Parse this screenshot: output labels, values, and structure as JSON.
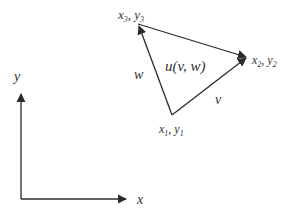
{
  "diagram": {
    "type": "triangle-element-with-coordinate-axes",
    "colors": {
      "stroke": "#2b2b2b",
      "text": "#333333",
      "background": "#ffffff"
    },
    "vertices": {
      "v1": {
        "label": "x",
        "sub": "1",
        "label2": "y",
        "sub2": "1",
        "x": 172,
        "y": 115
      },
      "v2": {
        "label": "x",
        "sub": "2",
        "label2": "y",
        "sub2": "2",
        "x": 248,
        "y": 57
      },
      "v3": {
        "label": "x",
        "sub": "3",
        "label2": "y",
        "sub2": "3",
        "x": 138,
        "y": 24
      }
    },
    "edges": {
      "v_edge_label": "v",
      "w_edge_label": "w"
    },
    "center_label": "u(v, w)",
    "axes": {
      "x_label": "x",
      "y_label": "y"
    }
  }
}
